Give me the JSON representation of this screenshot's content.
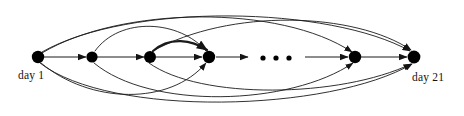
{
  "figure": {
    "type": "directed-graph-diagram",
    "width": 464,
    "height": 116,
    "background": "#ffffff",
    "stroke_color": "#1a1a1a",
    "node_color": "#000000",
    "baseline_y": 57
  },
  "labels": {
    "start_label": "day 1",
    "end_label": "day 21",
    "ellipsis": "• • •"
  },
  "nodes": [
    {
      "id": "n1",
      "name": "day-1-node",
      "x": 38,
      "y": 57,
      "r": 6.2,
      "label": "day 1"
    },
    {
      "id": "n2",
      "name": "node-2",
      "x": 92,
      "y": 57,
      "r": 5.6,
      "label": ""
    },
    {
      "id": "n3",
      "name": "node-3",
      "x": 150,
      "y": 57,
      "r": 6.0,
      "label": ""
    },
    {
      "id": "n4",
      "name": "node-4",
      "x": 209,
      "y": 57,
      "r": 6.2,
      "label": ""
    },
    {
      "id": "n5",
      "name": "node-5",
      "x": 355,
      "y": 57,
      "r": 6.2,
      "label": ""
    },
    {
      "id": "n6",
      "name": "day-21-node",
      "x": 414,
      "y": 57,
      "r": 6.4,
      "label": "day 21"
    }
  ],
  "ellipsis_dots": [
    {
      "x": 263,
      "y": 58,
      "r": 2.6
    },
    {
      "x": 276,
      "y": 58,
      "r": 2.6
    },
    {
      "x": 289,
      "y": 58,
      "r": 2.6
    }
  ],
  "straight_edges": [
    {
      "name": "edge-n1-n2",
      "from": "n1",
      "to": "n2",
      "x1": 44,
      "y1": 57,
      "x2": 86,
      "y2": 57,
      "arrow": true,
      "width": 1.0
    },
    {
      "name": "edge-n2-n3",
      "from": "n2",
      "to": "n3",
      "x1": 97,
      "y1": 57,
      "x2": 144,
      "y2": 57,
      "arrow": true,
      "width": 1.0
    },
    {
      "name": "edge-n3-n4",
      "from": "n3",
      "to": "n4",
      "x1": 156,
      "y1": 57,
      "x2": 202,
      "y2": 57,
      "arrow": true,
      "width": 1.0
    },
    {
      "name": "edge-n4-mid",
      "from": "n4",
      "to": "ellipsis",
      "x1": 216,
      "y1": 57,
      "x2": 248,
      "y2": 57,
      "arrow": true,
      "width": 1.0
    },
    {
      "name": "edge-mid-n5",
      "from": "ellipsis",
      "to": "n5",
      "x1": 305,
      "y1": 57,
      "x2": 348,
      "y2": 57,
      "arrow": true,
      "width": 1.0
    },
    {
      "name": "edge-n5-n6",
      "from": "n5",
      "to": "n6",
      "x1": 361,
      "y1": 57,
      "x2": 407,
      "y2": 57,
      "arrow": true,
      "width": 1.0
    }
  ],
  "arc_edges": [
    {
      "name": "arc-n1-n5-upper",
      "from": "n1",
      "to": "n5",
      "side": "above",
      "d": "M 42 53 C 120 6 280 4 352 52",
      "width": 0.9,
      "arrow": true
    },
    {
      "name": "arc-n1-n6-upper",
      "from": "n1",
      "to": "n6",
      "side": "above",
      "d": "M 42 52 C 130 2 330 6 410 51",
      "width": 0.9,
      "arrow": true
    },
    {
      "name": "arc-n3-n4-upper",
      "from": "n3",
      "to": "n4",
      "side": "above",
      "d": "M 153 51 C 170 36 192 40 207 50",
      "width": 2.2,
      "arrow": true
    },
    {
      "name": "arc-n3-n6-upper",
      "from": "n3",
      "to": "n6",
      "side": "above",
      "d": "M 153 51 C 230 8 355 12 411 50",
      "width": 0.9,
      "arrow": true
    },
    {
      "name": "arc-n4-n2-upper",
      "from": "n4",
      "to": "n2",
      "side": "above",
      "d": "M 206 51 C 180 20 120 16 95 51",
      "width": 0.9,
      "arrow": false
    },
    {
      "name": "arc-n1-n4-lower",
      "from": "n1",
      "to": "n4",
      "side": "below",
      "d": "M 41 63 C 90 104 170 106 206 63",
      "width": 0.9,
      "arrow": true
    },
    {
      "name": "arc-n2-n5-lower",
      "from": "n2",
      "to": "n5",
      "side": "below",
      "d": "M 94 63 C 150 110 290 106 353 63",
      "width": 0.9,
      "arrow": true
    },
    {
      "name": "arc-n1-n6-lower",
      "from": "n1",
      "to": "n6",
      "side": "below",
      "d": "M 40 63 C 110 118 330 112 412 64",
      "width": 0.9,
      "arrow": true
    },
    {
      "name": "arc-n3-n6-lower",
      "from": "n3",
      "to": "n6",
      "side": "below",
      "d": "M 149 63 C 200 100 340 98 411 64",
      "width": 0.9,
      "arrow": true
    }
  ],
  "text_items": [
    {
      "name": "day-1-caption",
      "text": "day 1",
      "x": 18,
      "y": 79,
      "anchor": "start"
    },
    {
      "name": "day-21-caption",
      "text": "day 21",
      "x": 412,
      "y": 81,
      "anchor": "start"
    }
  ]
}
